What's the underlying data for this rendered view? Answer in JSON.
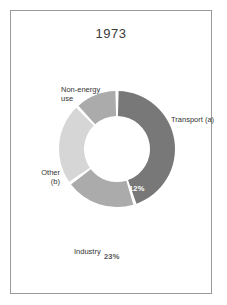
{
  "figure": {
    "title": "1973",
    "frame_color": "#9a9a9a",
    "background": "#ffffff"
  },
  "chart_data": {
    "type": "pie",
    "variant": "donut",
    "title": "1973",
    "subtitle": "",
    "xlabel": "",
    "ylabel": "",
    "unit": "%",
    "legend_position": "none",
    "grid": false,
    "labels_inside": true,
    "start_angle_deg": 0,
    "direction": "clockwise",
    "categories": [
      "Transport (a)",
      "Industry",
      "Other (b)",
      "Non-energy use"
    ],
    "values": [
      45,
      20,
      23,
      12
    ],
    "value_labels": [
      "45%",
      "20%",
      "23%",
      "12%"
    ],
    "colors": [
      "#787878",
      "#ababab",
      "#d6d6d6",
      "#ababab"
    ],
    "value_label_colors": [
      "#ffffff",
      "#ffffff",
      "#555555",
      "#ffffff"
    ],
    "slices": [
      {
        "name": "Transport (a)",
        "value": 45,
        "value_label": "45%",
        "color": "#787878"
      },
      {
        "name": "Industry",
        "value": 20,
        "value_label": "20%",
        "color": "#ababab"
      },
      {
        "name": "Other (b)",
        "value": 23,
        "value_label": "23%",
        "color": "#d6d6d6"
      },
      {
        "name": "Non-energy use",
        "value": 12,
        "value_label": "12%",
        "color": "#ababab"
      }
    ]
  },
  "annotations": {
    "transport_label": "Transport (a)",
    "industry_label": "Industry",
    "other_label_line1": "Other",
    "other_label_line2": "(b)",
    "nonenergy_label_line1": "Non-energy",
    "nonenergy_label_line2": "use",
    "transport_value": "45%",
    "industry_value": "20%",
    "other_value": "23%",
    "nonenergy_value": "12%"
  }
}
